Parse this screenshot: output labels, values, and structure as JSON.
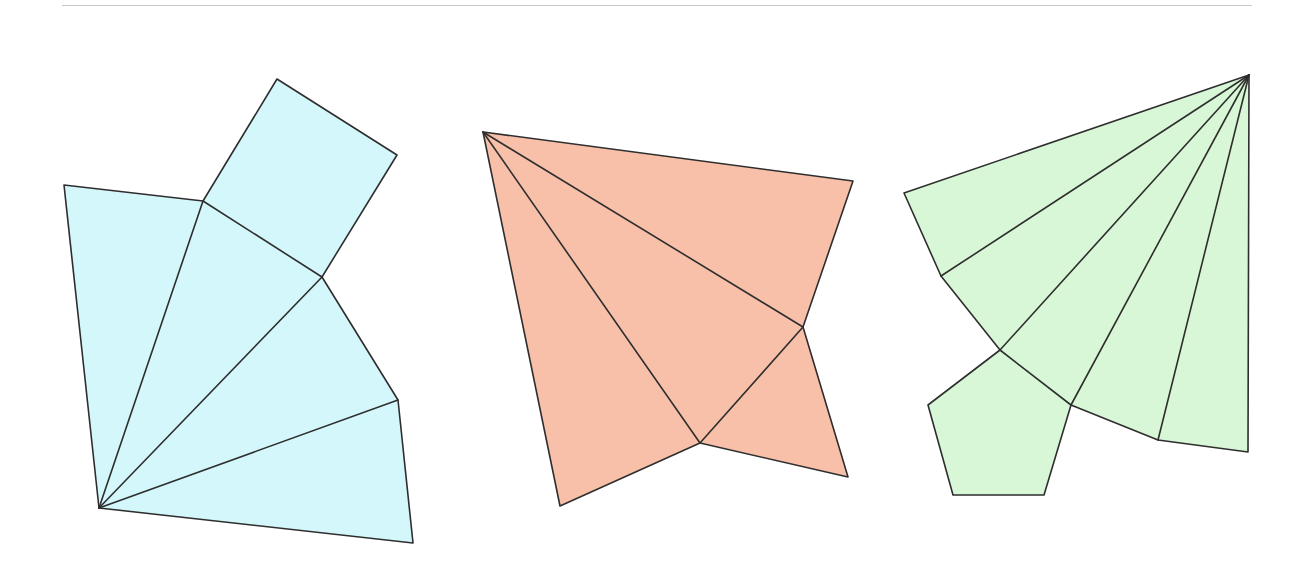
{
  "canvas": {
    "width": 1307,
    "height": 566,
    "background": "#ffffff"
  },
  "top_rule": {
    "color": "#c8c8c8"
  },
  "stroke": {
    "color": "#2e2e2e",
    "width": 1.6
  },
  "nets": [
    {
      "id": "cyan-net",
      "name": "square-pyramid-style net with fan of four triangles and attached square",
      "fill": "#d3f7fa",
      "outline": [
        [
          64,
          185
        ],
        [
          203,
          201
        ],
        [
          277,
          79
        ],
        [
          397,
          155
        ],
        [
          322,
          277
        ],
        [
          398,
          400
        ],
        [
          413,
          543
        ],
        [
          99,
          508
        ]
      ],
      "creases": [
        [
          [
            99,
            508
          ],
          [
            203,
            201
          ]
        ],
        [
          [
            203,
            201
          ],
          [
            322,
            277
          ]
        ],
        [
          [
            99,
            508
          ],
          [
            322,
            277
          ]
        ],
        [
          [
            99,
            508
          ],
          [
            398,
            400
          ]
        ]
      ]
    },
    {
      "id": "salmon-net",
      "name": "four-triangle net sharing apex at top-left",
      "fill": "#f9c0a9",
      "outline": [
        [
          483,
          132
        ],
        [
          853,
          181
        ],
        [
          803,
          327
        ],
        [
          848,
          477
        ],
        [
          700,
          443
        ],
        [
          560,
          506
        ]
      ],
      "creases": [
        [
          [
            483,
            132
          ],
          [
            803,
            327
          ]
        ],
        [
          [
            483,
            132
          ],
          [
            700,
            443
          ]
        ],
        [
          [
            700,
            443
          ],
          [
            803,
            327
          ]
        ]
      ]
    },
    {
      "id": "green-net",
      "name": "pentagonal pyramid net with fan of five triangles and attached pentagon",
      "fill": "#d8f7d6",
      "outline": [
        [
          1249,
          75
        ],
        [
          1248,
          452
        ],
        [
          1158,
          440
        ],
        [
          1071,
          405
        ],
        [
          1044,
          495
        ],
        [
          953,
          495
        ],
        [
          928,
          405
        ],
        [
          1000,
          350
        ],
        [
          941,
          276
        ],
        [
          904,
          193
        ]
      ],
      "creases": [
        [
          [
            1249,
            75
          ],
          [
            941,
            276
          ]
        ],
        [
          [
            1249,
            75
          ],
          [
            1000,
            350
          ]
        ],
        [
          [
            1249,
            75
          ],
          [
            1071,
            405
          ]
        ],
        [
          [
            1249,
            75
          ],
          [
            1158,
            440
          ]
        ],
        [
          [
            1000,
            350
          ],
          [
            1071,
            405
          ]
        ]
      ]
    }
  ]
}
